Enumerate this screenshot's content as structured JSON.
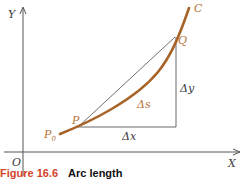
{
  "figure": {
    "caption_number": "Figure 16.6",
    "caption_title": "Arc length"
  },
  "axes": {
    "x_label": "X",
    "y_label": "Y",
    "origin_label": "O"
  },
  "points": {
    "p0": "P",
    "p0_sub": "0",
    "p": "P",
    "q": "Q",
    "curve": "C"
  },
  "increments": {
    "dx": "Δx",
    "dy": "Δy",
    "ds": "Δs"
  },
  "colors": {
    "curve": "#a86428",
    "labels_orange": "#b8743a",
    "axes": "#555555",
    "caption_number": "#d2452a"
  }
}
